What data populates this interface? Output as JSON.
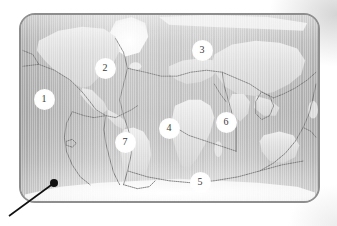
{
  "figure": {
    "frame_color": "#8e8e8e",
    "ocean_color": "#bcbcbc",
    "land_color": "#dadada",
    "boundary_color": "#6f6f6f",
    "marker_fill": "#ffffff",
    "marker_text_color": "#3a3a3a",
    "pointer_color": "#111111"
  },
  "markers": [
    {
      "label": "1",
      "name": "marker-1",
      "x": 44,
      "y": 99
    },
    {
      "label": "2",
      "name": "marker-2",
      "x": 105,
      "y": 68
    },
    {
      "label": "3",
      "name": "marker-3",
      "x": 202,
      "y": 50
    },
    {
      "label": "4",
      "name": "marker-4",
      "x": 169,
      "y": 128
    },
    {
      "label": "5",
      "name": "marker-5",
      "x": 200,
      "y": 182
    },
    {
      "label": "6",
      "name": "marker-6",
      "x": 226,
      "y": 122
    },
    {
      "label": "7",
      "name": "marker-7",
      "x": 125,
      "y": 142
    }
  ],
  "pointer": {
    "name": "callout-pointer",
    "dot": {
      "x": 54,
      "y": 183,
      "r": 4
    },
    "line": {
      "x1": 54,
      "y1": 183,
      "x2": 9,
      "y2": 216
    }
  },
  "map_frame": {
    "x": 19,
    "y": 13,
    "width": 301,
    "height": 190,
    "corner_radius": 16
  }
}
